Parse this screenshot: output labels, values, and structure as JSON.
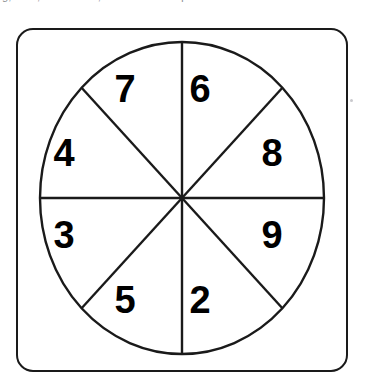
{
  "page": {
    "background_color": "#ffffff",
    "top_caption_fragment": "g, and , in the area, to the nearest quarter."
  },
  "spinner": {
    "title": "eight-sector-spinner",
    "frame": {
      "shape": "rounded-square",
      "stroke_color": "#1a1a1a",
      "fill_color": "#ffffff",
      "corner_radius": 17
    },
    "circle": {
      "stroke_color": "#1a1a1a",
      "fill_color": "#ffffff",
      "center_x": 166,
      "center_y": 170,
      "radius_x": 142,
      "radius_y": 156
    },
    "sector_count": 8,
    "sectors": [
      {
        "id": "sector-top-right",
        "label": "6",
        "position": "top-right",
        "label_x": 196,
        "label_y": 70
      },
      {
        "id": "sector-right-upper",
        "label": "8",
        "position": "right-upper",
        "label_x": 262,
        "label_y": 132
      },
      {
        "id": "sector-right-lower",
        "label": "9",
        "position": "right-lower",
        "label_x": 262,
        "label_y": 216
      },
      {
        "id": "sector-bottom-right",
        "label": "2",
        "position": "bottom-right",
        "label_x": 196,
        "label_y": 283
      },
      {
        "id": "sector-bottom-left",
        "label": "5",
        "position": "bottom-left",
        "label_x": 117,
        "label_y": 283
      },
      {
        "id": "sector-left-lower",
        "label": "3",
        "position": "left-lower",
        "label_x": 54,
        "label_y": 216
      },
      {
        "id": "sector-left-upper",
        "label": "4",
        "position": "left-upper",
        "label_x": 54,
        "label_y": 132
      },
      {
        "id": "sector-top-left",
        "label": "7",
        "position": "top-left",
        "label_x": 117,
        "label_y": 70
      }
    ],
    "divider_lines": [
      "vertical-diameter",
      "horizontal-diameter",
      "diagonal-nw-se",
      "diagonal-ne-sw"
    ]
  }
}
